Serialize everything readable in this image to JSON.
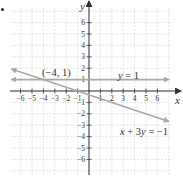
{
  "chart_data": {
    "type": "line",
    "title": "",
    "xlabel": "x",
    "ylabel": "y",
    "xlim": [
      -6.8,
      7
    ],
    "ylim": [
      -7,
      7.5
    ],
    "grid": true,
    "x_ticks": [
      -6,
      -5,
      -4,
      -3,
      -2,
      -1,
      1,
      2,
      3,
      4,
      5,
      6
    ],
    "y_ticks": [
      -6,
      -5,
      -4,
      -3,
      -2,
      -1,
      1,
      2,
      3,
      4,
      5,
      6
    ],
    "x_tick_labels": [
      "-6",
      "-5",
      "-4",
      "-3",
      "-2",
      "-1",
      "1",
      "2",
      "3",
      "4",
      "5",
      "6"
    ],
    "y_tick_labels": [
      "-6",
      "-5",
      "-4",
      "-3",
      "-2",
      "-1",
      "1",
      "2",
      "3",
      "4",
      "5",
      "6"
    ],
    "series": [
      {
        "name": "y = 1",
        "equation": "y = 1",
        "x": [
          -6.8,
          7
        ],
        "y": [
          1,
          1
        ],
        "arrows": "both",
        "color": "#a8a8a8"
      },
      {
        "name": "x + 3y = -1",
        "equation": "x + 3y = -1",
        "x": [
          -6.8,
          7
        ],
        "y": [
          1.93,
          -2.67
        ],
        "arrows": "both",
        "color": "#a8a8a8"
      }
    ],
    "annotations": [
      {
        "text": "(−4, 1)",
        "x": -4,
        "y": 1,
        "type": "intersection-point"
      },
      {
        "text": "y = 1",
        "near_series": "y = 1"
      },
      {
        "text": "x + 3y = −1",
        "near_series": "x + 3y = -1"
      }
    ]
  },
  "labels": {
    "x_axis": "x",
    "y_axis": "y",
    "point": "(−4, 1)",
    "line1": "y = 1",
    "line2_left": "x + 3",
    "line2_y": "y",
    "line2_right": " = −1",
    "line1_y": "y",
    "line1_rest": " = 1"
  },
  "colors": {
    "axis": "#333333",
    "grid": "#d0d0d0",
    "line": "#a8a8a8",
    "text": "#333333"
  }
}
